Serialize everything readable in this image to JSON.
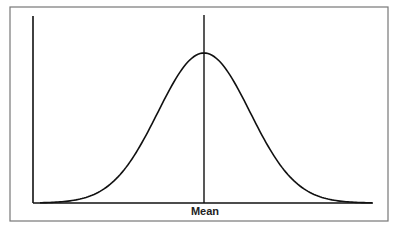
{
  "figure": {
    "x_label": "Mean",
    "colors": {
      "line": "#111111",
      "frame": "#777777",
      "background": "#ffffff"
    }
  },
  "chart_data": {
    "type": "line",
    "title": "",
    "xlabel": "Mean",
    "ylabel": "",
    "series": [
      {
        "name": "normal distribution",
        "shape": "bell curve",
        "peak_at": "mean"
      }
    ],
    "annotations": [
      "vertical line at mean"
    ],
    "grid": false
  }
}
